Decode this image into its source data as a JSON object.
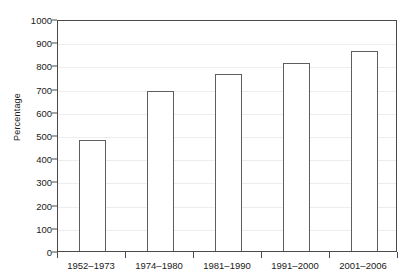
{
  "chart_data": {
    "type": "bar",
    "title": "",
    "subtitle": "",
    "xlabel": "",
    "ylabel": "Percentage",
    "categories": [
      "1952–1973",
      "1974–1980",
      "1981–1990",
      "1991–2000",
      "2001–2006"
    ],
    "values": [
      480,
      690,
      765,
      810,
      860
    ],
    "series": [
      {
        "name": "Percentage",
        "values": [
          480,
          690,
          765,
          810,
          860
        ]
      }
    ],
    "ylim": [
      0,
      1000
    ],
    "y_ticks": [
      0,
      100,
      200,
      300,
      400,
      500,
      600,
      700,
      800,
      900,
      1000
    ],
    "y_tick_labels": [
      "0",
      "100",
      "200",
      "300",
      "400",
      "500",
      "600",
      "700",
      "800",
      "900",
      "1000"
    ],
    "grid": true,
    "grid_axis": "y",
    "legend": false,
    "legend_position": "none",
    "bar_fill_color": "#ffffff",
    "bar_edge_color": "#5e5e5e",
    "grid_color": "#ededed",
    "axis_color": "#4a4a4a",
    "text_color": "#1a1a1a",
    "background_color": "#ffffff"
  }
}
